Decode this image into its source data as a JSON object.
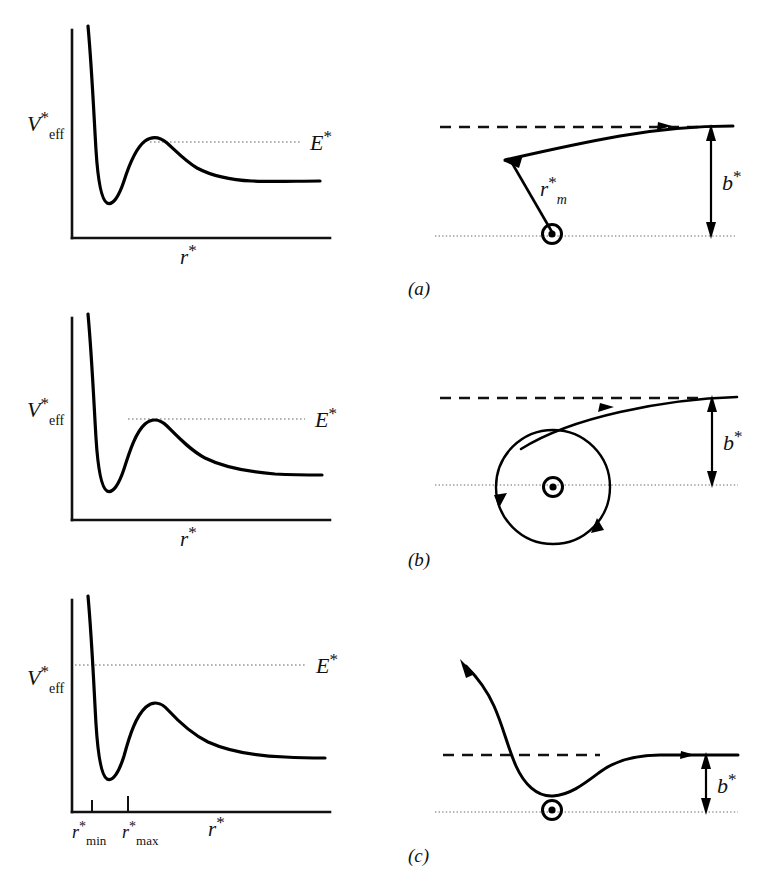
{
  "figure": {
    "kind": "scattering-trajectory-figure",
    "rows": [
      {
        "id": "a",
        "panel_label": "(a)",
        "potential": {
          "y_axis_label_main": "V",
          "y_axis_label_star": "*",
          "y_axis_label_sub": "eff",
          "x_axis_label_main": "r",
          "x_axis_label_star": "*",
          "energy_label_main": "E",
          "energy_label_star": "*",
          "energy_level_relative": "below barrier maximum",
          "energy_line_starts_on_curve": true
        },
        "trajectory": {
          "impact_param_label_main": "b",
          "impact_param_label_star": "*",
          "closest_approach_label_main": "r",
          "closest_approach_label_star": "*",
          "closest_approach_label_sub": "m",
          "center_marker": "target-center-icon",
          "type": "deflected-repelled",
          "has_closest_approach_line": true
        }
      },
      {
        "id": "b",
        "panel_label": "(b)",
        "potential": {
          "y_axis_label_main": "V",
          "y_axis_label_star": "*",
          "y_axis_label_sub": "eff",
          "x_axis_label_main": "r",
          "x_axis_label_star": "*",
          "energy_label_main": "E",
          "energy_label_star": "*",
          "energy_level_relative": "exactly at barrier maximum",
          "energy_line_starts_on_curve": true
        },
        "trajectory": {
          "impact_param_label_main": "b",
          "impact_param_label_star": "*",
          "center_marker": "target-center-icon",
          "type": "orbiting-spiral",
          "has_closest_approach_line": false
        }
      },
      {
        "id": "c",
        "panel_label": "(c)",
        "potential": {
          "y_axis_label_main": "V",
          "y_axis_label_star": "*",
          "y_axis_label_sub": "eff",
          "x_axis_label_main": "r",
          "x_axis_label_star": "*",
          "energy_label_main": "E",
          "energy_label_star": "*",
          "energy_level_relative": "above barrier maximum",
          "energy_line_starts_on_curve": false,
          "tick_labels": [
            {
              "main": "r",
              "star": "*",
              "sub": "min"
            },
            {
              "main": "r",
              "star": "*",
              "sub": "max"
            }
          ]
        },
        "trajectory": {
          "impact_param_label_main": "b",
          "impact_param_label_star": "*",
          "center_marker": "target-center-icon",
          "type": "attracted-deflected",
          "has_closest_approach_line": false
        }
      }
    ],
    "colors": {
      "ink": "#111111",
      "curve": "#000000",
      "energy_line": "#9a9a9a",
      "axis_line": "#111111",
      "background": "#ffffff"
    }
  }
}
